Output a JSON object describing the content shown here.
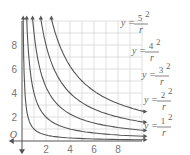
{
  "chart_data": {
    "type": "line",
    "title": "",
    "xlabel": "r",
    "ylabel": "y",
    "xlim": [
      0,
      10
    ],
    "ylim": [
      0,
      10
    ],
    "grid": true,
    "x_ticks": [
      "2",
      "4",
      "6",
      "8"
    ],
    "y_ticks": [
      "2",
      "4",
      "6",
      "8"
    ],
    "origin_label": "O",
    "series": [
      {
        "name": "y = 5^2 / r",
        "k": 25,
        "numerator": "5",
        "exponent": "2"
      },
      {
        "name": "y = 4^2 / r",
        "k": 16,
        "numerator": "4",
        "exponent": "2"
      },
      {
        "name": "y = 3^2 / r",
        "k": 9,
        "numerator": "3",
        "exponent": "2"
      },
      {
        "name": "y = 2^2 / r",
        "k": 4,
        "numerator": "2",
        "exponent": "2"
      },
      {
        "name": "y = 1^2 / r",
        "k": 1,
        "numerator": "1",
        "exponent": "2"
      }
    ],
    "legend": "inline labels at right"
  },
  "labels": {
    "y": "y",
    "eq": "=",
    "r": "r"
  }
}
